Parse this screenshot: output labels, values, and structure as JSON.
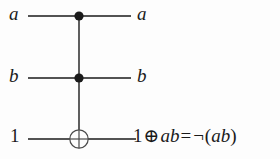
{
  "figure": {
    "name": "toffoli-gate-circuit",
    "background_color": "#fdfdfd",
    "ink_color": "#1a1a1a",
    "width": 280,
    "height": 159
  },
  "wires": [
    {
      "id": "wire-top",
      "input_label": "a",
      "output_label": "a",
      "y": 16,
      "x_start": 28,
      "x_end": 131,
      "gate": "control-dot"
    },
    {
      "id": "wire-middle",
      "input_label": "b",
      "output_label": "b",
      "y": 78,
      "x_start": 28,
      "x_end": 131,
      "gate": "control-dot"
    },
    {
      "id": "wire-bottom",
      "input_label": "1",
      "output_label": "1 ⊕ ab = ¬(ab)",
      "y": 139,
      "x_start": 28,
      "x_end": 136,
      "gate": "xor-target"
    }
  ],
  "gates": {
    "control_dot_top": {
      "cx": 79,
      "cy": 16,
      "r": 4.6
    },
    "control_dot_middle": {
      "cx": 79,
      "cy": 78,
      "r": 4.6
    },
    "xor_target": {
      "cx": 79,
      "cy": 139,
      "r": 9.2
    },
    "vertical_connector": {
      "x": 79,
      "y_top": 16,
      "y_bottom": 139
    }
  },
  "labels": {
    "input_a": "a",
    "input_b": "b",
    "input_one": "1",
    "output_a": "a",
    "output_b": "b",
    "output_expression": {
      "operand_one": "1",
      "xor_symbol": "⊕",
      "product": "ab",
      "equals_symbol": "=",
      "not_symbol": "¬",
      "open_paren": "(",
      "negated_product": "ab",
      "close_paren": ")",
      "full_text": "1 ⊕ ab = ¬(ab)"
    }
  }
}
